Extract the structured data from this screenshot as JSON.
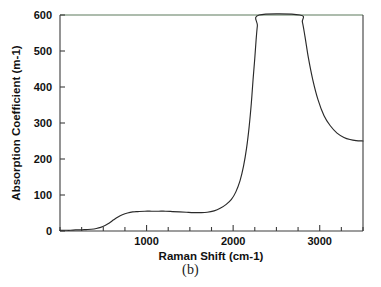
{
  "figure": {
    "caption": "(b)"
  },
  "chart_data": {
    "type": "line",
    "title": "",
    "subtitle": "",
    "xlabel": "Raman Shift (cm-1)",
    "ylabel": "Absorption Coefficient (m-1)",
    "xlim": [
      0,
      3500
    ],
    "ylim": [
      0,
      600
    ],
    "grid": false,
    "legend": null,
    "legend_position": "none",
    "x_ticks": [
      0,
      250,
      500,
      750,
      1000,
      1250,
      1500,
      1750,
      2000,
      2250,
      2500,
      2750,
      3000,
      3250,
      3500
    ],
    "x_tick_labels": [
      "",
      "",
      "",
      "",
      "1000",
      "",
      "",
      "",
      "2000",
      "",
      "",
      "",
      "3000",
      "",
      ""
    ],
    "x_major_ticks": [
      1000,
      2000,
      3000
    ],
    "y_ticks": [
      0,
      100,
      200,
      300,
      400,
      500,
      600
    ],
    "y_tick_labels": [
      "0",
      "100",
      "200",
      "300",
      "400",
      "500",
      "600"
    ],
    "series": [
      {
        "name": "absorption",
        "color": "#2a2a2a",
        "clipped_above_ylim": true,
        "x": [
          0,
          60,
          120,
          180,
          240,
          300,
          360,
          420,
          470,
          520,
          570,
          620,
          670,
          720,
          780,
          840,
          900,
          980,
          1060,
          1140,
          1220,
          1300,
          1380,
          1460,
          1540,
          1620,
          1700,
          1780,
          1850,
          1920,
          1980,
          2030,
          2080,
          2120,
          2155,
          2185,
          2210,
          2230,
          2250,
          2265,
          2280,
          2300,
          2770,
          2800,
          2830,
          2870,
          2920,
          2980,
          3050,
          3120,
          3200,
          3280,
          3350,
          3420,
          3500
        ],
        "y": [
          2,
          2,
          2,
          3,
          3,
          4,
          5,
          7,
          10,
          15,
          22,
          31,
          39,
          45,
          50,
          53,
          54,
          55,
          55,
          55,
          55,
          54,
          53,
          52,
          51,
          51,
          52,
          56,
          63,
          74,
          88,
          108,
          140,
          180,
          230,
          290,
          355,
          420,
          480,
          530,
          570,
          600,
          600,
          580,
          540,
          480,
          420,
          365,
          320,
          293,
          272,
          260,
          254,
          251,
          250
        ]
      }
    ]
  }
}
